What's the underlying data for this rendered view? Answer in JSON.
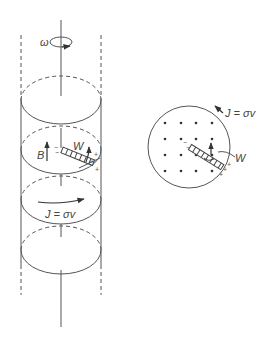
{
  "figure": {
    "left_panel": {
      "description": "Rotating conducting cylinder with axial magnetic field",
      "labels": {
        "omega": "ω",
        "magnetic_field": "B",
        "strip": "W",
        "current": "J = σv"
      },
      "charges": {
        "negative": "−",
        "positive": "+"
      }
    },
    "right_panel": {
      "description": "Top-view cross-section with field dots",
      "labels": {
        "current": "J = σv",
        "strip": "W"
      },
      "dot_grid": {
        "rows": 4,
        "cols": 4
      }
    },
    "colors": {
      "line": "#555555",
      "text": "#444444",
      "background": "#ffffff"
    }
  }
}
